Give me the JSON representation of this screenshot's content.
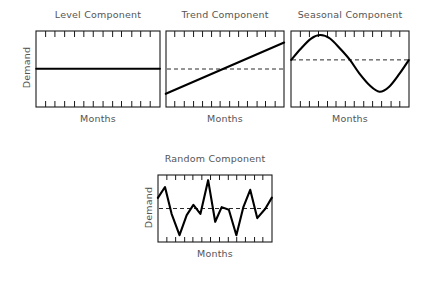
{
  "figure": {
    "background_color": "#ffffff",
    "line_color": "#000000",
    "frame_color": "#1a1a1a",
    "text_color": "#555555",
    "midline_style": "dashed"
  },
  "panels": [
    {
      "id": "level",
      "title": "Level Component",
      "x_label": "Months",
      "y_label": "Demand",
      "box": {
        "x": 36,
        "y": 31,
        "w": 124,
        "h": 76
      },
      "ticks": {
        "top": 13,
        "bottom": 13,
        "length": 6
      },
      "has_midline": false
    },
    {
      "id": "trend",
      "title": "Trend Component",
      "x_label": "Months",
      "y_label": "",
      "box": {
        "x": 166,
        "y": 31,
        "w": 118,
        "h": 76
      },
      "ticks": {
        "top": 13,
        "bottom": 13,
        "length": 6
      },
      "has_midline": true
    },
    {
      "id": "seasonal",
      "title": "Seasonal Component",
      "x_label": "Months",
      "y_label": "",
      "box": {
        "x": 291,
        "y": 31,
        "w": 118,
        "h": 76
      },
      "ticks": {
        "top": 13,
        "bottom": 13,
        "length": 6
      },
      "has_midline": true
    },
    {
      "id": "random",
      "title": "Random Component",
      "x_label": "Months",
      "y_label": "Demand",
      "box": {
        "x": 158,
        "y": 175,
        "w": 114,
        "h": 67
      },
      "ticks": {
        "top": 13,
        "bottom": 13,
        "length": 5
      },
      "has_midline": true
    }
  ],
  "chart_data": [
    {
      "type": "line",
      "id": "level",
      "title": "Level Component",
      "xlabel": "Months",
      "ylabel": "Demand",
      "xlim": [
        0,
        1
      ],
      "ylim": [
        0,
        1
      ],
      "grid": false,
      "legend": "none",
      "midline": null,
      "series": [
        {
          "name": "Level",
          "x": [
            0,
            1
          ],
          "values": [
            0.5,
            0.5
          ]
        }
      ],
      "annotation": "Constant horizontal line: demand stays flat over months."
    },
    {
      "type": "line",
      "id": "trend",
      "title": "Trend Component",
      "xlabel": "Months",
      "ylabel": "Demand",
      "xlim": [
        0,
        1
      ],
      "ylim": [
        0,
        1
      ],
      "grid": false,
      "legend": "none",
      "midline": 0.5,
      "series": [
        {
          "name": "Trend",
          "x": [
            0,
            1
          ],
          "values": [
            0.17,
            0.85
          ]
        }
      ],
      "annotation": "Steadily increasing straight line crossing the dashed mean level near the middle."
    },
    {
      "type": "line",
      "id": "seasonal",
      "title": "Seasonal Component",
      "xlabel": "Months",
      "ylabel": "Demand",
      "xlim": [
        0,
        1
      ],
      "ylim": [
        0,
        1
      ],
      "grid": false,
      "legend": "none",
      "midline": 0.62,
      "series": [
        {
          "name": "Seasonal",
          "x": [
            0.0,
            0.08,
            0.17,
            0.25,
            0.33,
            0.42,
            0.5,
            0.58,
            0.67,
            0.75,
            0.83,
            0.92,
            1.0
          ],
          "values": [
            0.62,
            0.76,
            0.9,
            0.95,
            0.9,
            0.76,
            0.62,
            0.44,
            0.28,
            0.2,
            0.26,
            0.44,
            0.62
          ]
        }
      ],
      "annotation": "One full sine wave cycle: peak at about one quarter, trough at about three quarters."
    },
    {
      "type": "line",
      "id": "random",
      "title": "Random Component",
      "xlabel": "Months",
      "ylabel": "Demand",
      "xlim": [
        0,
        1
      ],
      "ylim": [
        0,
        1
      ],
      "grid": false,
      "legend": "none",
      "midline": 0.5,
      "series": [
        {
          "name": "Random",
          "x": [
            0.0,
            0.06,
            0.12,
            0.19,
            0.25,
            0.31,
            0.37,
            0.44,
            0.5,
            0.56,
            0.62,
            0.69,
            0.75,
            0.81,
            0.87,
            0.94,
            1.0
          ],
          "values": [
            0.66,
            0.82,
            0.42,
            0.1,
            0.4,
            0.55,
            0.42,
            0.92,
            0.3,
            0.52,
            0.48,
            0.1,
            0.52,
            0.78,
            0.36,
            0.5,
            0.66
          ]
        }
      ],
      "annotation": "Irregular zigzag noise oscillating above and below the dashed mean level."
    }
  ]
}
